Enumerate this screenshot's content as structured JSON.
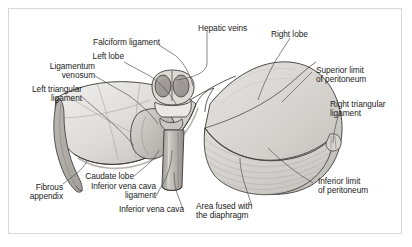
{
  "figure": {
    "type": "anatomical-illustration",
    "frame_color": "#d8d8d8",
    "background_color": "#ffffff",
    "text_color": "#1a1a1a",
    "leader_line_color": "#555555",
    "organ_fill_light": "#e6e5e3",
    "organ_fill_mid": "#cfcdca",
    "organ_fill_dark": "#b4b1ad",
    "outline_color": "#3c3a38"
  },
  "labels": {
    "hepatic_veins": "Hepatic veins",
    "falciform_ligament": "Falciform ligament",
    "left_lobe": "Left lobe",
    "ligamentum_venosum": "Ligamentum\nvenosum",
    "left_triangular_ligament": "Left triangular\nligament",
    "fibrous_appendix": "Fibrous\nappendix",
    "caudate_lobe": "Caudate lobe",
    "inferior_vena_cava_ligament": "Inferior vena cava\nligament",
    "inferior_vena_cava": "Inferior vena cava",
    "area_fused_with_diaphragm": "Area fused with\nthe diaphragm",
    "right_lobe": "Right lobe",
    "superior_limit_of_peritoneum": "Superior limit\nof peritoneum",
    "right_triangular_ligament": "Right triangular\nligament",
    "inferior_limit_of_peritoneum": "Inferior limit\nof peritoneum"
  }
}
